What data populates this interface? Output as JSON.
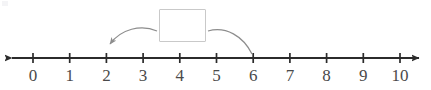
{
  "diagram": {
    "type": "number-line",
    "title_visible": false,
    "axis": {
      "label": "number-line-axis",
      "start_value": 0,
      "end_value": 10,
      "tick_values": [
        0,
        1,
        2,
        3,
        4,
        5,
        6,
        7,
        8,
        9,
        10
      ],
      "tick_labels": [
        "0",
        "1",
        "2",
        "3",
        "4",
        "5",
        "6",
        "7",
        "8",
        "9",
        "10"
      ],
      "left_arrow": true,
      "right_arrow": true,
      "axis_color": "#2b2b2b",
      "label_color": "#4a4a4a"
    },
    "answer_box": {
      "name": "answer-input-box",
      "value": "",
      "placeholder": "",
      "border_color": "#c9c9c9",
      "fill_color": "#ffffff"
    },
    "connectors": [
      {
        "name": "arrow-to-2",
        "from": "answer-box-left",
        "to_value": 2,
        "has_arrowhead": true,
        "color": "#8d8d8d"
      },
      {
        "name": "curve-to-6",
        "from": "answer-box-right",
        "to_value": 6,
        "has_arrowhead": false,
        "color": "#8d8d8d"
      }
    ]
  }
}
